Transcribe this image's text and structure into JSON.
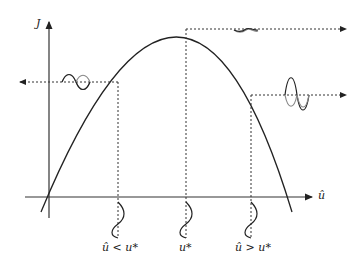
{
  "diagram": {
    "axes": {
      "y_label": "J",
      "x_label": "û"
    },
    "curve": {
      "shape": "concave parabola",
      "peak_label": "u*"
    },
    "markers": [
      {
        "id": "left",
        "label": "û < u*",
        "arrow": "left",
        "oscillation": "large"
      },
      {
        "id": "peak",
        "label": "u*",
        "arrow": "right",
        "oscillation": "small"
      },
      {
        "id": "right",
        "label": "û > u*",
        "arrow": "right",
        "oscillation": "largest"
      }
    ],
    "colors": {
      "line": "#222222",
      "secondary_wave": "#888888"
    }
  }
}
